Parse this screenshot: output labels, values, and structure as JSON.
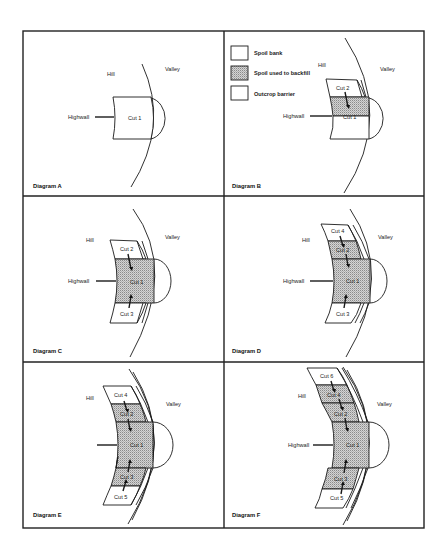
{
  "figure": {
    "colors": {
      "line": "#1a1a1a",
      "shade_fill": "#c8c8c8",
      "background": "#ffffff"
    },
    "legend": {
      "items": [
        {
          "label": "Spoil bank",
          "pattern": "blank"
        },
        {
          "label": "Spoil used to backfill",
          "pattern": "stipple"
        },
        {
          "label": "Outcrop barrier",
          "pattern": "blank"
        }
      ]
    },
    "panels": {
      "A": {
        "caption": "Diagram A",
        "hill": "Hill",
        "valley": "Valley",
        "highwall": "Highwall",
        "cuts": [
          "Cut 1"
        ]
      },
      "B": {
        "caption": "Diagram B",
        "hill": "Hill",
        "valley": "Valley",
        "highwall": "Highwall",
        "cuts": [
          "Cut 1",
          "Cut 2"
        ]
      },
      "C": {
        "caption": "Diagram C",
        "hill": "Hill",
        "valley": "Valley",
        "highwall": "Highwall",
        "cuts": [
          "Cut 1",
          "Cut 2",
          "Cut 3"
        ]
      },
      "D": {
        "caption": "Diagram D",
        "hill": "Hill",
        "valley": "Valley",
        "highwall": "Highwall",
        "cuts": [
          "Cut 1",
          "Cut 2",
          "Cut 3",
          "Cut 4"
        ]
      },
      "E": {
        "caption": "Diagram E",
        "hill": "Hill",
        "valley": "Valley",
        "cuts": [
          "Cut 1",
          "Cut 2",
          "Cut 3",
          "Cut 4",
          "Cut 5"
        ]
      },
      "F": {
        "caption": "Diagram F",
        "hill": "Hill",
        "valley": "Valley",
        "highwall": "Highwall",
        "cuts": [
          "Cut 1",
          "Cut 2",
          "Cut 3",
          "Cut 4",
          "Cut 5",
          "Cut 6"
        ]
      }
    }
  }
}
